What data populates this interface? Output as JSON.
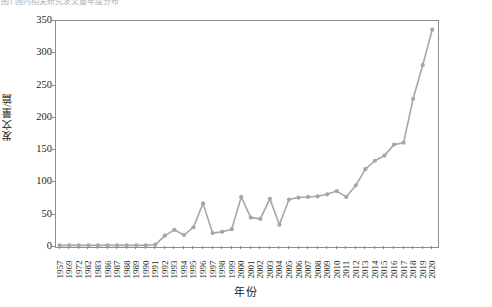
{
  "top_caption": "图1 国内相关研究发文量年度分布",
  "axes": {
    "y_title": "发文量/篇",
    "x_title": "年份",
    "y_ticks": [
      0,
      50,
      100,
      150,
      200,
      250,
      300,
      350
    ],
    "y_min": 0,
    "y_max": 350
  },
  "style": {
    "line_color": "#a6a6a6",
    "marker_color": "#a6a6a6",
    "frame_color": "#8c8c8c",
    "text_color": "#231f20"
  },
  "chart_data": {
    "type": "line",
    "title": "",
    "xlabel": "年份",
    "ylabel": "发文量/篇",
    "ylim": [
      0,
      350
    ],
    "yticks": [
      0,
      50,
      100,
      150,
      200,
      250,
      300,
      350
    ],
    "grid": false,
    "legend": "none",
    "categories": [
      "1957",
      "1969",
      "1972",
      "1982",
      "1983",
      "1986",
      "1987",
      "1988",
      "1989",
      "1990",
      "1991",
      "1992",
      "1993",
      "1994",
      "1995",
      "1996",
      "1997",
      "1998",
      "1999",
      "2000",
      "2001",
      "2002",
      "2003",
      "2004",
      "2005",
      "2006",
      "2007",
      "2008",
      "2009",
      "2010",
      "2011",
      "2012",
      "2013",
      "2014",
      "2015",
      "2016",
      "2017",
      "2018",
      "2019",
      "2020"
    ],
    "series": [
      {
        "name": "发文量",
        "values": [
          1,
          1,
          1,
          1,
          1,
          1,
          1,
          1,
          1,
          1,
          2,
          16,
          25,
          17,
          29,
          66,
          20,
          22,
          26,
          76,
          44,
          42,
          73,
          33,
          72,
          75,
          76,
          77,
          80,
          85,
          76,
          94,
          119,
          132,
          140,
          157,
          160,
          228,
          280,
          335
        ]
      }
    ]
  }
}
